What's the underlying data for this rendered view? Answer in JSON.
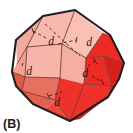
{
  "figure": {
    "panel_label": "(B)",
    "caption_label_text": "(B)",
    "object_name": "rhombic-dodecahedron-crystal",
    "background_color": "#FFFFFF",
    "outline_color": "#231F20",
    "colors": {
      "face_light": "#F7B9AE",
      "face_light_2": "#F5AEA2",
      "face_mid": "#E8705F",
      "face_mid_2": "#E2604F",
      "face_red": "#ED2A24",
      "face_red_dark": "#D81F1B",
      "face_red_deep": "#C4181A",
      "outline": "#231F20",
      "interior_line": "#6E3A33",
      "dashed_line": "#4A2420"
    },
    "labels": [
      {
        "id": "d-top-center",
        "text": "d",
        "x": 53,
        "y": 42,
        "size": "normal"
      },
      {
        "id": "d-upper-right",
        "text": "d",
        "x": 88,
        "y": 43,
        "size": "normal"
      },
      {
        "id": "d-left",
        "text": "d",
        "x": 28,
        "y": 72,
        "size": "normal"
      },
      {
        "id": "d-right",
        "text": "d",
        "x": 84,
        "y": 74,
        "size": "normal"
      },
      {
        "id": "d-bottom-center",
        "text": "d",
        "x": 56,
        "y": 103,
        "size": "normal"
      }
    ],
    "label_symbol": "d",
    "label_count": 5,
    "dashed_leader_count": 5,
    "geometry": {
      "outline_points": "75,10 110,35 124,63 108,97 70,121 33,104 12,72 16,40 43,16",
      "top_vertex": [
        75,
        10
      ],
      "bottom_vertex": [
        70,
        121
      ],
      "left_vertex": [
        12,
        72
      ],
      "right_vertex": [
        124,
        63
      ]
    }
  }
}
